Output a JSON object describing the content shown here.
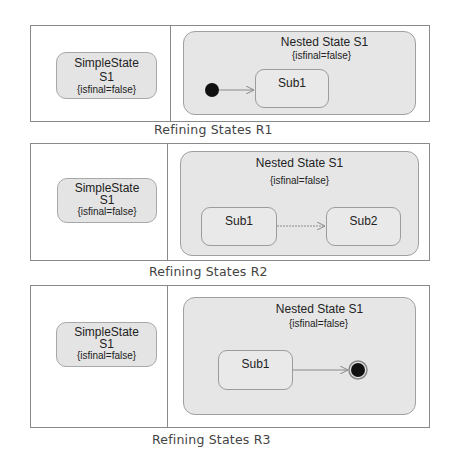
{
  "diagrams": [
    {
      "caption": "Refining States R1",
      "simple_state": {
        "name": "SimpleState",
        "id": "S1",
        "constraint": "{isfinal=false}"
      },
      "nested_state": {
        "name": "Nested State S1",
        "constraint": "{isfinal=false}",
        "substates": [
          {
            "name": "Sub1"
          }
        ],
        "pseudostates": [
          {
            "kind": "initial"
          }
        ],
        "transitions": [
          {
            "from": "initial",
            "to": "Sub1"
          }
        ]
      }
    },
    {
      "caption": "Refining States R2",
      "simple_state": {
        "name": "SimpleState",
        "id": "S1",
        "constraint": "{isfinal=false}"
      },
      "nested_state": {
        "name": "Nested State S1",
        "constraint": "{isfinal=false}",
        "substates": [
          {
            "name": "Sub1"
          },
          {
            "name": "Sub2"
          }
        ],
        "transitions": [
          {
            "from": "Sub1",
            "to": "Sub2"
          }
        ]
      }
    },
    {
      "caption": "Refining States R3",
      "simple_state": {
        "name": "SimpleState",
        "id": "S1",
        "constraint": "{isfinal=false}"
      },
      "nested_state": {
        "name": "Nested State S1",
        "constraint": "{isfinal=false}",
        "substates": [
          {
            "name": "Sub1"
          }
        ],
        "pseudostates": [
          {
            "kind": "final"
          }
        ],
        "transitions": [
          {
            "from": "Sub1",
            "to": "final"
          }
        ]
      }
    }
  ],
  "colors": {
    "frame_border": "#8a8a8a",
    "state_fill": "#e4e4e4",
    "state_border": "#a8a8a8",
    "pseudostate": "#111111",
    "transition": "#8a8a8a"
  }
}
